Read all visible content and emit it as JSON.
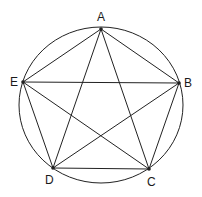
{
  "diagram": {
    "type": "pentagram-inscribed-in-circle",
    "circle": {
      "cx": 101,
      "cy": 105,
      "rx": 82,
      "ry": 78
    },
    "stroke_color": "#222222",
    "vertices": [
      {
        "label": "A",
        "x": 101,
        "y": 29,
        "label_x": 97,
        "label_y": 11
      },
      {
        "label": "B",
        "x": 179,
        "y": 83,
        "label_x": 184,
        "label_y": 77
      },
      {
        "label": "C",
        "x": 149,
        "y": 169,
        "label_x": 147,
        "label_y": 176
      },
      {
        "label": "D",
        "x": 53,
        "y": 168,
        "label_x": 45,
        "label_y": 174
      },
      {
        "label": "E",
        "x": 23,
        "y": 82,
        "label_x": 10,
        "label_y": 76
      }
    ],
    "edges": [
      [
        "A",
        "B"
      ],
      [
        "B",
        "C"
      ],
      [
        "C",
        "D"
      ],
      [
        "D",
        "E"
      ],
      [
        "E",
        "A"
      ],
      [
        "A",
        "C"
      ],
      [
        "A",
        "D"
      ],
      [
        "B",
        "D"
      ],
      [
        "B",
        "E"
      ],
      [
        "C",
        "E"
      ]
    ]
  }
}
